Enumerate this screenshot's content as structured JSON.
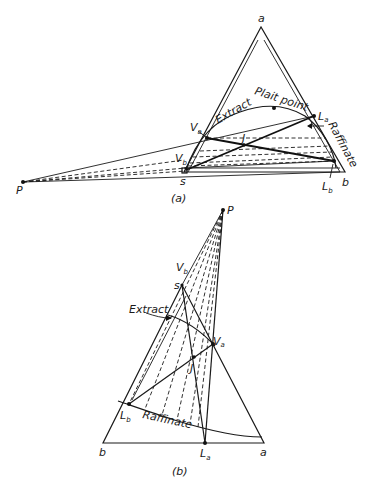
{
  "figure": {
    "panel_a": {
      "caption": "(a)",
      "vertices": {
        "a": "a",
        "b": "b",
        "s": "s"
      },
      "points": {
        "P": "P",
        "La": "L",
        "La_sub": "a",
        "Lb": "L",
        "Lb_sub": "b",
        "Va": "V",
        "Va_sub": "a",
        "Vb": "V",
        "Vb_sub": "b",
        "J": "J"
      },
      "curve_labels": {
        "extract": "Extract",
        "plait_point": "Plait point",
        "raffinate": "Raffinate"
      }
    },
    "panel_b": {
      "caption": "(b)",
      "vertices": {
        "a": "a",
        "b": "b",
        "s": "s"
      },
      "points": {
        "P": "P",
        "La": "L",
        "La_sub": "a",
        "Lb": "L",
        "Lb_sub": "b",
        "Va": "V",
        "Va_sub": "a",
        "Vb": "V",
        "Vb_sub": "b",
        "J": "J"
      },
      "curve_labels": {
        "extract": "Extract",
        "raffinate": "Raffinate"
      }
    }
  }
}
